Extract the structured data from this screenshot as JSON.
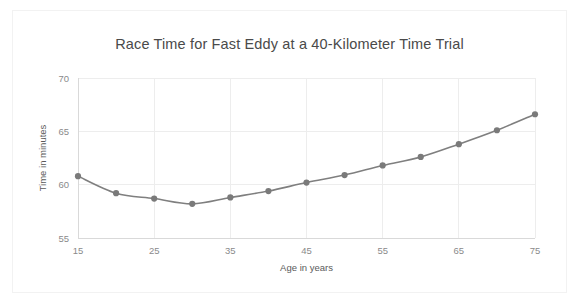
{
  "figure": {
    "background_color": "#ffffff",
    "frame_color": "#f2f2f2"
  },
  "chart_data": {
    "type": "line",
    "title": "Race Time for Fast Eddy at a 40-Kilometer Time Trial",
    "xlabel": "Age in years",
    "ylabel": "Time in minutes",
    "x": [
      15,
      20,
      25,
      30,
      35,
      40,
      45,
      50,
      55,
      60,
      65,
      70,
      75
    ],
    "values": [
      60.8,
      59.2,
      58.7,
      58.2,
      58.8,
      59.4,
      60.2,
      60.9,
      61.8,
      62.6,
      63.8,
      65.1,
      66.6
    ],
    "series": [
      {
        "name": "Race time",
        "color": "#7f7f7f",
        "marker": "circle",
        "values": [
          60.8,
          59.2,
          58.7,
          58.2,
          58.8,
          59.4,
          60.2,
          60.9,
          61.8,
          62.6,
          63.8,
          65.1,
          66.6
        ]
      }
    ],
    "xlim": [
      15,
      75
    ],
    "ylim": [
      55,
      70
    ],
    "xticks": [
      15,
      25,
      35,
      45,
      55,
      65,
      75
    ],
    "xtick_labels": [
      "15",
      "25",
      "35",
      "45",
      "55",
      "65",
      "75"
    ],
    "yticks": [
      55,
      60,
      65,
      70
    ],
    "ytick_labels": [
      "55",
      "60",
      "65",
      "70"
    ],
    "grid": true,
    "grid_axis": "both",
    "grid_color": "#ededed",
    "legend": false,
    "legend_position": "none",
    "line_color": "#7f7f7f",
    "marker_color": "#7a7a7a",
    "title_color": "#4a4a4a",
    "tick_label_color": "#8a8a8a",
    "axis_label_color": "#5a5a5a"
  }
}
